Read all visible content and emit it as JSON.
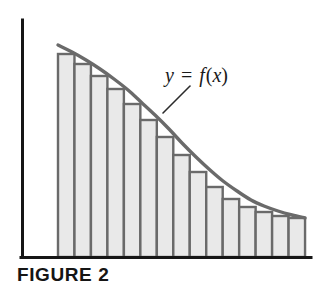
{
  "figure": {
    "caption": "FIGURE 2",
    "curve_label": "y = f(x)",
    "curve_label_parts": {
      "y": "y",
      "equals": "=",
      "f": "f",
      "paren_open": "(",
      "x": "x",
      "paren_close": ")"
    }
  },
  "colors": {
    "axis": "#161616",
    "curve": "#6a6a6a",
    "bar_fill": "#e9e9e9",
    "bar_stroke": "#6a6a6a",
    "leader": "#2b2b2b",
    "text": "#151515",
    "background": "#ffffff"
  },
  "chart_data": {
    "type": "area",
    "title": "FIGURE 2",
    "subtitle": "",
    "xlabel": "",
    "ylabel": "",
    "grid": false,
    "legend": null,
    "annotations": [
      {
        "text": "y = f(x)",
        "x_px": 165,
        "y_px": 82,
        "leader_from_px": [
          190,
          86
        ],
        "leader_to_px": [
          163,
          113
        ]
      }
    ],
    "axes": {
      "x_axis_px": {
        "x1": 22,
        "y1": 257,
        "x2": 311,
        "y2": 257
      },
      "y_axis_px": {
        "x1": 22,
        "y1": 20,
        "x2": 22,
        "y2": 257
      },
      "origin_px": [
        22,
        257
      ],
      "xlim_px": [
        22,
        311
      ],
      "ylim_px": [
        257,
        20
      ]
    },
    "curve": {
      "name": "y = f(x)",
      "description": "convex decreasing curve",
      "points_px": [
        [
          58,
          45
        ],
        [
          72,
          52
        ],
        [
          86,
          60
        ],
        [
          100,
          69
        ],
        [
          114,
          79
        ],
        [
          128,
          90
        ],
        [
          141,
          102
        ],
        [
          155,
          115
        ],
        [
          169,
          129
        ],
        [
          182,
          143
        ],
        [
          196,
          157
        ],
        [
          210,
          170
        ],
        [
          223,
          181
        ],
        [
          237,
          191
        ],
        [
          251,
          200
        ],
        [
          264,
          206
        ],
        [
          278,
          211
        ],
        [
          292,
          215
        ],
        [
          305,
          218
        ]
      ]
    },
    "rectangles": {
      "kind": "right-endpoint Riemann sum",
      "count": 15,
      "x_start_px": 58,
      "x_end_px": 305,
      "baseline_px": 257,
      "width_px": 16.47,
      "tops_px": [
        54,
        64,
        76,
        89,
        104,
        120,
        137,
        155,
        172,
        187,
        199,
        207,
        212,
        216,
        218
      ],
      "heights_px": [
        203,
        193,
        181,
        168,
        153,
        137,
        120,
        102,
        85,
        70,
        58,
        50,
        45,
        41,
        39
      ]
    }
  }
}
